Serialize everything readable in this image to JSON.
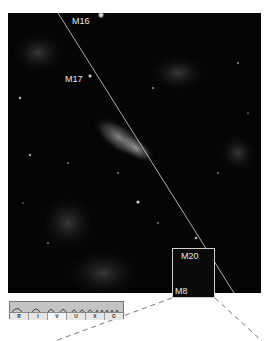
{
  "figure": {
    "labels": [
      {
        "id": "m16",
        "text": "M16"
      },
      {
        "id": "m17",
        "text": "M17"
      },
      {
        "id": "m20",
        "text": "M20"
      },
      {
        "id": "m8",
        "text": "M8"
      }
    ],
    "spectrum_bar": {
      "bands": [
        "R",
        "I",
        "V",
        "U",
        "X",
        "G"
      ],
      "highlighted_band": "V"
    },
    "inset_box": {
      "contains": [
        "M20",
        "M8"
      ]
    },
    "colors": {
      "sky": "#050505",
      "line": "#d8d8d8",
      "label": "#e8e8e8",
      "inset_border": "#cfcfcf",
      "leader_dash": "#555555"
    }
  }
}
